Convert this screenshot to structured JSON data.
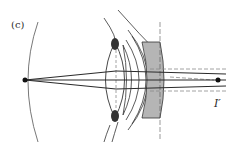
{
  "figure": {
    "panel_label": "(c)",
    "image_label": "I′",
    "colors": {
      "line": "#2b2b2b",
      "thin_line": "#555555",
      "dashed": "#8a8a8a",
      "lens_fill": "#b5b5b5",
      "dark_fill": "#333333",
      "point": "#111111"
    }
  }
}
